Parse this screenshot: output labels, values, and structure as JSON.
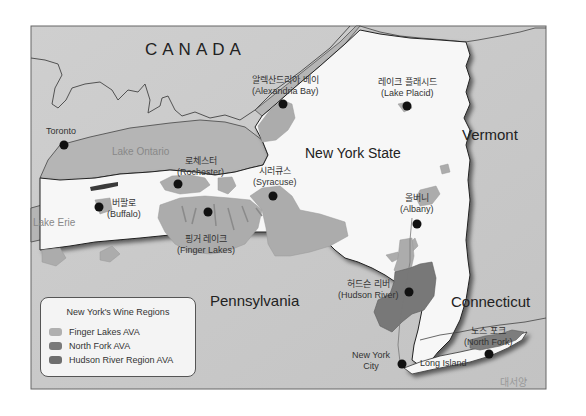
{
  "map": {
    "title_state": "New York State",
    "regions": {
      "canada": "CANADA",
      "vermont": "Vermont",
      "pennsylvania": "Pennsylvania",
      "connecticut": "Connecticut",
      "atlantic_ko": "대서양"
    },
    "water": {
      "lake_ontario": "Lake Ontario",
      "lake_erie": "Lake Erie"
    },
    "cities": [
      {
        "ko": "",
        "en": "Toronto"
      },
      {
        "ko": "알렉산드리아 베이",
        "en": "(Alexandria Bay)"
      },
      {
        "ko": "레이크 플래시드",
        "en": "(Lake Placid)"
      },
      {
        "ko": "로체스터",
        "en": "(Rochester)"
      },
      {
        "ko": "시러큐스",
        "en": "(Syracuse)"
      },
      {
        "ko": "버팔로",
        "en": "(Buffalo)"
      },
      {
        "ko": "핑거 레이크",
        "en": "(Finger Lakes)"
      },
      {
        "ko": "올버니",
        "en": "(Albany)"
      },
      {
        "ko": "허드슨 리버",
        "en": "(Hudson River)"
      },
      {
        "ko": "노스 포크",
        "en": "(North Fork)"
      },
      {
        "ko": "",
        "en": "New York"
      },
      {
        "ko": "",
        "en": "City"
      },
      {
        "ko": "",
        "en": "Long Island"
      }
    ],
    "colors": {
      "background_land": "#c8c8c8",
      "water": "#b4b4b4",
      "ny_state": "#f7f7f7",
      "finger_lakes": "#aaaaaa",
      "north_fork": "#7d7d7d",
      "hudson_river": "#787878"
    }
  },
  "legend": {
    "title": "New York's Wine Regions",
    "items": [
      {
        "label": "Finger Lakes AVA",
        "color": "#b0b0b0"
      },
      {
        "label": "North Fork AVA",
        "color": "#7a7a7a"
      },
      {
        "label": "Hudson River Region AVA",
        "color": "#6e6e6e"
      }
    ]
  }
}
